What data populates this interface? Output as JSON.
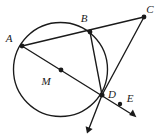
{
  "figure": {
    "kind": "euclidean-geometry-diagram",
    "background_color": "#ffffff",
    "ink_color": "#1a1a1a",
    "canvas": {
      "width": 161,
      "height": 137
    }
  },
  "circle": {
    "name": "circle-M",
    "center_label": "M",
    "center": {
      "x": 60.5,
      "y": 69.5
    },
    "radius": 47,
    "stroke_width": 1.3
  },
  "points": [
    {
      "id": "A",
      "label": "A",
      "x": 22,
      "y": 46,
      "label_x": 9,
      "label_y": 42,
      "on_circle": true,
      "dot": true
    },
    {
      "id": "B",
      "label": "B",
      "x": 90,
      "y": 32,
      "label_x": 84,
      "label_y": 22,
      "on_circle": true,
      "dot": true
    },
    {
      "id": "C",
      "label": "C",
      "x": 144,
      "y": 17,
      "label_x": 148,
      "label_y": 13,
      "on_circle": false,
      "dot": true
    },
    {
      "id": "D",
      "label": "D",
      "x": 102,
      "y": 95,
      "label_x": 110,
      "label_y": 97,
      "on_circle": true,
      "dot": true
    },
    {
      "id": "E",
      "label": "E",
      "x": 120,
      "y": 104,
      "label_x": 128,
      "label_y": 102,
      "on_circle": false,
      "dot": true
    },
    {
      "id": "M",
      "label": "M",
      "x": 61,
      "y": 70,
      "label_x": 44,
      "label_y": 84,
      "on_circle": false,
      "dot": true
    }
  ],
  "dot_radius": 2.3,
  "segments": [
    {
      "id": "A-to-C",
      "name": "secant-A-B-C",
      "from": "A",
      "to": "C",
      "x1": 22,
      "y1": 46,
      "x2": 144,
      "y2": 17,
      "arrow": false
    },
    {
      "id": "B-to-D",
      "name": "chord-B-D",
      "from": "B",
      "to": "D",
      "x1": 90,
      "y1": 32,
      "x2": 102,
      "y2": 95,
      "arrow": false
    },
    {
      "id": "C-to-D",
      "name": "segment-C-D",
      "from": "C",
      "to": "D",
      "x1": 144,
      "y1": 17,
      "x2": 102,
      "y2": 95,
      "arrow": false
    }
  ],
  "rays": [
    {
      "id": "ray-A-D-E",
      "name": "ray-through-A-M-D-E",
      "x1": 22,
      "y1": 46,
      "x2": 136,
      "y2": 117,
      "arrow": true
    },
    {
      "id": "ray-C-D-down",
      "name": "ray-from-C-through-D-downward",
      "x1": 144,
      "y1": 17,
      "x2": 87,
      "y2": 133,
      "arrow": true
    }
  ],
  "arrowheads": [
    {
      "id": "arrow-AE",
      "name": "arrowhead-lower-right",
      "tip_x": 136,
      "tip_y": 117,
      "angle_deg": 31.9
    },
    {
      "id": "arrow-CD",
      "name": "arrowhead-lower-left",
      "tip_x": 87,
      "tip_y": 133,
      "angle_deg": 116.2
    }
  ],
  "stroke_widths": {
    "line": 1.35,
    "circle": 1.35
  }
}
